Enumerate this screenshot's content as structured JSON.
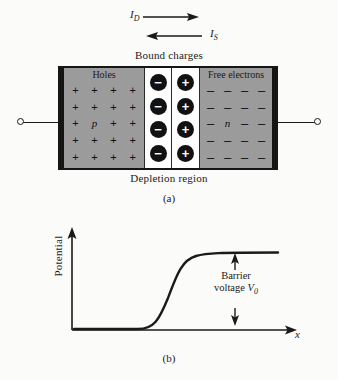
{
  "figure": {
    "currents": {
      "diffusion_label": "I",
      "diffusion_sub": "D",
      "saturation_label": "I",
      "saturation_sub": "S"
    },
    "top_caption": "Bound charges",
    "bottom_caption": "Depletion region",
    "p_region": {
      "title": "Holes",
      "letter": "p",
      "symbol": "+",
      "rows": 5,
      "cols": 4
    },
    "n_region": {
      "title": "Free electrons",
      "letter": "n",
      "symbol": "–",
      "rows": 5,
      "cols": 4
    },
    "depletion": {
      "negative_symbol": "−",
      "positive_symbol": "+",
      "circle_rows": 4
    },
    "subcaption_a": "(a)",
    "subcaption_b": "(b)"
  },
  "chart_data": {
    "type": "line",
    "title": "",
    "xlabel": "x",
    "ylabel": "Potential",
    "annotation_line1": "Barrier",
    "annotation_line2": "voltage",
    "annotation_symbol": "V",
    "annotation_sub": "0",
    "grid": false,
    "legend": null,
    "xlim": [
      0,
      100
    ],
    "ylim": [
      0,
      100
    ],
    "x": [
      0,
      10,
      20,
      30,
      35,
      40,
      45,
      50,
      55,
      60,
      65,
      70,
      80,
      90,
      100
    ],
    "y": [
      0,
      0,
      0,
      0,
      2,
      8,
      24,
      48,
      72,
      88,
      96,
      99,
      100,
      100,
      100
    ],
    "series": [
      {
        "name": "Potential",
        "values": [
          0,
          0,
          0,
          0,
          2,
          8,
          24,
          48,
          72,
          88,
          96,
          99,
          100,
          100,
          100
        ]
      }
    ],
    "barrier_value_top": 100,
    "barrier_value_bottom": 0
  },
  "colors": {
    "semiconductor_gray": "#9b9b9b",
    "bound_charge_black": "#111111",
    "outline_black": "#151515",
    "background": "#fbfbf9"
  }
}
